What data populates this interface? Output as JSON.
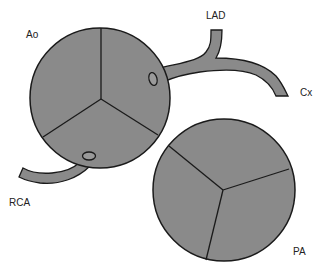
{
  "labels": {
    "ao": "Ao",
    "lad": "LAD",
    "cx": "Cx",
    "rca": "RCA",
    "pa": "PA"
  },
  "colors": {
    "fill": "#8a8a8a",
    "stroke": "#1a1a1a",
    "background": "#ffffff"
  }
}
